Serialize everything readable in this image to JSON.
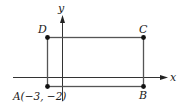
{
  "diagram": {
    "type": "coordinate-plane-rectangle",
    "axes": {
      "x_label": "x",
      "y_label": "y"
    },
    "points": [
      {
        "name": "A",
        "label": "A(−3, −2)",
        "coords": [
          -3,
          -2
        ]
      },
      {
        "name": "B",
        "label": "B"
      },
      {
        "name": "C",
        "label": "C"
      },
      {
        "name": "D",
        "label": "D"
      }
    ],
    "colors": {
      "axis": "#333333",
      "rectangle": "#555555",
      "point": "#111111"
    }
  }
}
